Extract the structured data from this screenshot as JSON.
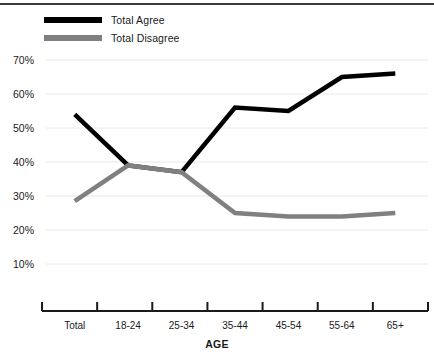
{
  "chart_data": {
    "type": "line",
    "title": "",
    "subtitle": "",
    "xlabel": "AGE",
    "ylabel": "",
    "categories": [
      "Total",
      "18-24",
      "25-34",
      "35-44",
      "45-54",
      "55-64",
      "65+"
    ],
    "series": [
      {
        "name": "Total Agree",
        "color": "#000000",
        "values": [
          54,
          39,
          37,
          56,
          55,
          65,
          66
        ]
      },
      {
        "name": "Total Disagree",
        "color": "#808080",
        "values": [
          28.5,
          39,
          37,
          25,
          24,
          24,
          25
        ]
      }
    ],
    "ylim": [
      0,
      75
    ],
    "yticks": [
      10,
      20,
      30,
      40,
      50,
      60,
      70
    ],
    "ytick_labels": [
      "10%",
      "20%",
      "30%",
      "40%",
      "50%",
      "60%",
      "70%"
    ],
    "grid": "horizontal",
    "legend_position": "top-left",
    "annotations": []
  },
  "legend": {
    "items": [
      {
        "label": "Total Agree",
        "color": "#000000"
      },
      {
        "label": "Total Disagree",
        "color": "#808080"
      }
    ]
  },
  "axes": {
    "x_title": "AGE"
  },
  "style": {
    "gridline_color": "#e8e8e8",
    "axis_color": "#1a1a1a",
    "top_rule_color": "#3a3a3a",
    "background": "#ffffff"
  }
}
